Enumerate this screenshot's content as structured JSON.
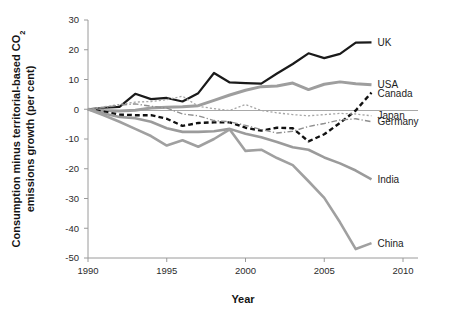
{
  "chart_data": {
    "type": "line",
    "title": "",
    "xlabel": "Year",
    "ylabel": "Consumption minus territorial-based CO₂ emissions growth (per cent)",
    "ylabel_line1": "Consumption minus territorial-based CO",
    "ylabel_sub": "2",
    "ylabel_line2": "emissions growth (per cent)",
    "xlim": [
      1990,
      2010
    ],
    "ylim": [
      -50,
      30
    ],
    "grid": false,
    "legend_position": "right-inline",
    "xticks": [
      1990,
      1995,
      2000,
      2005,
      2010
    ],
    "yticks": [
      30,
      20,
      10,
      0,
      -10,
      -20,
      -30,
      -40,
      -50
    ],
    "x": [
      1990,
      1991,
      1992,
      1993,
      1994,
      1995,
      1996,
      1997,
      1998,
      1999,
      2000,
      2001,
      2002,
      2003,
      2004,
      2005,
      2006,
      2007,
      2008
    ],
    "series": [
      {
        "name": "UK",
        "color": "#1a1a1a",
        "style": "solid",
        "width": 2.2,
        "label_y": 22.5,
        "values": [
          0,
          0.5,
          0.8,
          5.2,
          3.4,
          3.8,
          2.6,
          5.4,
          12.2,
          9.0,
          8.8,
          8.6,
          12.0,
          15.2,
          18.8,
          17.2,
          18.6,
          22.4,
          22.5
        ]
      },
      {
        "name": "USA",
        "color": "#9e9e9e",
        "style": "solid",
        "width": 3.0,
        "label_y": 8.2,
        "values": [
          0,
          -0.4,
          -0.6,
          -0.3,
          0.4,
          0.7,
          0.8,
          1.2,
          3.0,
          4.8,
          6.4,
          7.6,
          7.8,
          8.8,
          6.6,
          8.4,
          9.2,
          8.6,
          8.2
        ]
      },
      {
        "name": "Canada",
        "color": "#111111",
        "style": "dashed",
        "width": 2.4,
        "label_y": 5.4,
        "values": [
          0,
          -0.8,
          -1.8,
          -2.0,
          -2.0,
          -3.2,
          -5.6,
          -4.6,
          -4.4,
          -4.4,
          -6.2,
          -7.2,
          -6.2,
          -6.4,
          -10.8,
          -8.4,
          -4.6,
          -0.4,
          5.6
        ]
      },
      {
        "name": "Japan",
        "color": "#a6a6a6",
        "style": "dotted",
        "width": 1.3,
        "label_y": -2.2,
        "values": [
          0,
          0.8,
          1.6,
          2.4,
          2.6,
          3.2,
          4.4,
          1.0,
          0.2,
          -0.4,
          1.6,
          -0.4,
          -1.2,
          -1.8,
          -2.2,
          -1.8,
          -1.4,
          -1.6,
          -2.2
        ]
      },
      {
        "name": "Germany",
        "color": "#8f8f8f",
        "style": "dashdot",
        "width": 1.4,
        "label_y": -4.2,
        "values": [
          0,
          0.6,
          1.4,
          1.8,
          1.0,
          0.4,
          -1.6,
          -2.2,
          -3.8,
          -4.2,
          -5.4,
          -6.8,
          -8.0,
          -7.4,
          -5.8,
          -4.8,
          -3.6,
          -3.2,
          -4.2
        ]
      },
      {
        "name": "India",
        "color": "#9b9b9b",
        "style": "solid",
        "width": 2.6,
        "label_y": -23.6,
        "values": [
          0,
          -1.4,
          -2.6,
          -3.0,
          -4.2,
          -6.4,
          -7.6,
          -7.6,
          -7.4,
          -6.6,
          -8.2,
          -9.4,
          -11.0,
          -12.8,
          -13.6,
          -16.2,
          -18.2,
          -20.6,
          -23.6
        ]
      },
      {
        "name": "China",
        "color": "#a0a0a0",
        "style": "solid",
        "width": 2.6,
        "label_y": -45.0,
        "values": [
          0,
          -2.0,
          -4.2,
          -6.6,
          -9.0,
          -12.2,
          -10.4,
          -12.6,
          -10.0,
          -6.8,
          -14.0,
          -13.6,
          -16.4,
          -18.8,
          -24.2,
          -29.8,
          -38.0,
          -47.0,
          -45.0
        ]
      }
    ]
  }
}
